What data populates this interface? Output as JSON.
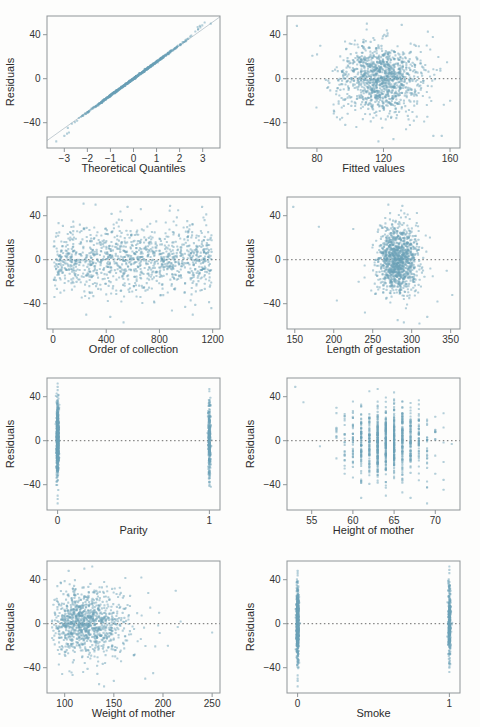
{
  "figure": {
    "shared_ylabel": "Residuals"
  },
  "colors": {
    "point": "#6ba1b7",
    "point_opacity": 0.5,
    "panel_border": "#8f9598",
    "tick_text": "#333333",
    "label_text": "#2b2b2b",
    "zero_line": "#5a5a5a",
    "ref_line": "#c3cdd3",
    "background": "#fdfdfc"
  },
  "chart_data": [
    {
      "id": "qq-plot",
      "type": "scatter",
      "xlabel": "Theoretical Quantiles",
      "ylabel": "Residuals",
      "xlim": [
        -3.75,
        3.75
      ],
      "ylim": [
        -63,
        57
      ],
      "xticks": [
        -3,
        -2,
        -1,
        0,
        1,
        2,
        3
      ],
      "yticks": [
        40,
        0,
        -40
      ],
      "zero_line": false,
      "ref_line": {
        "slope": 15.0,
        "intercept": 0
      },
      "gen": {
        "kind": "qq",
        "n": 650,
        "seed": 11,
        "slope": 15.3,
        "noise": 0.4,
        "tail_dev": {
          "hi_start": 2.35,
          "hi_slope": 5,
          "lo_start": -2.55,
          "lo_slope": 2.5
        }
      },
      "extra_points": [
        [
          -3.35,
          -57
        ],
        [
          -3.0,
          -52
        ],
        [
          -2.88,
          -50
        ],
        [
          -2.8,
          -49
        ],
        [
          2.78,
          47
        ],
        [
          2.88,
          48
        ],
        [
          2.98,
          48.5
        ],
        [
          3.35,
          50
        ]
      ]
    },
    {
      "id": "fitted-values",
      "type": "scatter",
      "xlabel": "Fitted values",
      "ylabel": "Residuals",
      "xlim": [
        62,
        166
      ],
      "ylim": [
        -63,
        57
      ],
      "xticks": [
        80,
        120,
        160
      ],
      "yticks": [
        40,
        0,
        -40
      ],
      "zero_line": true,
      "gen": {
        "kind": "cloud",
        "n": 1150,
        "seed": 22,
        "x": {
          "dist": "normal",
          "mean": 119,
          "sd": 12.5,
          "clip": [
            67,
            159
          ]
        },
        "y": {
          "dist": "normal",
          "mean": 0,
          "sd": 15.5,
          "clip": [
            -50,
            47
          ]
        }
      },
      "extra_points": [
        [
          68,
          48
        ],
        [
          82,
          30
        ],
        [
          92,
          -35
        ],
        [
          97,
          -42
        ],
        [
          117,
          -57
        ],
        [
          126,
          -55
        ],
        [
          150,
          -52
        ],
        [
          155,
          -52
        ],
        [
          160,
          -20
        ],
        [
          152,
          8
        ],
        [
          148,
          2
        ],
        [
          144,
          -2
        ],
        [
          110,
          50
        ],
        [
          131,
          49
        ],
        [
          122,
          44
        ]
      ]
    },
    {
      "id": "order-of-collection",
      "type": "scatter",
      "xlabel": "Order of collection",
      "ylabel": "Residuals",
      "xlim": [
        -45,
        1255
      ],
      "ylim": [
        -63,
        57
      ],
      "xticks": [
        0,
        400,
        800,
        1200
      ],
      "yticks": [
        40,
        0,
        -40
      ],
      "zero_line": true,
      "gen": {
        "kind": "cloud",
        "n": 1150,
        "seed": 33,
        "x": {
          "dist": "uniform",
          "min": 4,
          "max": 1192,
          "clip": [
            4,
            1192
          ]
        },
        "y": {
          "dist": "normal",
          "mean": 0,
          "sd": 15,
          "clip": [
            -48,
            46
          ]
        }
      },
      "extra_points": [
        [
          320,
          50
        ],
        [
          560,
          48
        ],
        [
          660,
          46
        ],
        [
          250,
          -50
        ],
        [
          530,
          -57
        ],
        [
          1050,
          -50
        ],
        [
          1120,
          48
        ],
        [
          230,
          51
        ],
        [
          880,
          49
        ],
        [
          430,
          -52
        ]
      ]
    },
    {
      "id": "length-of-gestation",
      "type": "scatter",
      "xlabel": "Length of gestation",
      "ylabel": "Residuals",
      "xlim": [
        140,
        362
      ],
      "ylim": [
        -63,
        57
      ],
      "xticks": [
        150,
        200,
        250,
        300,
        350
      ],
      "yticks": [
        40,
        0,
        -40
      ],
      "zero_line": true,
      "gen": {
        "kind": "cloud",
        "n": 1100,
        "seed": 44,
        "x": {
          "dist": "normal",
          "mean": 281,
          "sd": 13,
          "clip": [
            222,
            338
          ]
        },
        "y": {
          "dist": "normal",
          "mean": 0,
          "sd": 15.5,
          "clip": [
            -50,
            47
          ]
        }
      },
      "extra_points": [
        [
          148,
          48
        ],
        [
          181,
          30
        ],
        [
          204,
          -37
        ],
        [
          225,
          28
        ],
        [
          232,
          -20
        ],
        [
          240,
          -48
        ],
        [
          352,
          -32
        ],
        [
          345,
          -10
        ],
        [
          333,
          -38
        ],
        [
          320,
          -52
        ],
        [
          310,
          -58
        ],
        [
          327,
          -15
        ],
        [
          318,
          22
        ],
        [
          290,
          -57
        ],
        [
          282,
          -55
        ],
        [
          270,
          50
        ],
        [
          288,
          49
        ]
      ]
    },
    {
      "id": "parity",
      "type": "scatter",
      "xlabel": "Parity",
      "ylabel": "Residuals",
      "xlim": [
        -0.07,
        1.07
      ],
      "ylim": [
        -63,
        57
      ],
      "xticks": [
        0,
        1
      ],
      "yticks": [
        40,
        0,
        -40
      ],
      "zero_line": true,
      "gen": {
        "kind": "cloud",
        "n": 950,
        "seed": 55,
        "x": {
          "dist": "binary",
          "values": [
            0,
            1
          ],
          "p0": 0.67,
          "jitter": 0.004,
          "clip": [
            -0.05,
            1.05
          ]
        },
        "y": {
          "dist": "normal",
          "mean": 0,
          "sd": 16,
          "clip": [
            -45,
            43
          ]
        }
      },
      "extra_points": [
        [
          0,
          52
        ],
        [
          0,
          49
        ],
        [
          0,
          46
        ],
        [
          0,
          -50
        ],
        [
          0,
          -53
        ],
        [
          0,
          -57
        ],
        [
          1,
          47
        ],
        [
          1,
          45
        ],
        [
          1,
          -38
        ],
        [
          1,
          -41
        ]
      ]
    },
    {
      "id": "height-of-mother",
      "type": "scatter",
      "xlabel": "Height of mother",
      "ylabel": "Residuals",
      "xlim": [
        52,
        73
      ],
      "ylim": [
        -63,
        57
      ],
      "xticks": [
        55,
        60,
        65,
        70
      ],
      "yticks": [
        40,
        0,
        -40
      ],
      "zero_line": true,
      "gen": {
        "kind": "cloud",
        "n": 950,
        "seed": 66,
        "x": {
          "dist": "integer-normal",
          "mean": 64.2,
          "sd": 2.4,
          "clip": [
            58,
            71
          ]
        },
        "y": {
          "dist": "normal",
          "mean": 0,
          "sd": 15,
          "clip": [
            -45,
            43
          ]
        }
      },
      "extra_points": [
        [
          53,
          49
        ],
        [
          54,
          35
        ],
        [
          56,
          -5
        ],
        [
          58,
          30
        ],
        [
          58,
          10
        ],
        [
          69,
          -57
        ],
        [
          72,
          -3
        ],
        [
          71,
          25
        ],
        [
          71,
          12
        ],
        [
          70,
          -30
        ],
        [
          61,
          -52
        ],
        [
          64,
          -50
        ],
        [
          63,
          47
        ],
        [
          66,
          -47
        ],
        [
          67,
          -52
        ],
        [
          65,
          44
        ],
        [
          62,
          45
        ]
      ]
    },
    {
      "id": "weight-of-mother",
      "type": "scatter",
      "xlabel": "Weight of mother",
      "ylabel": "Residuals",
      "xlim": [
        82,
        258
      ],
      "ylim": [
        -63,
        57
      ],
      "xticks": [
        100,
        150,
        200,
        250
      ],
      "yticks": [
        40,
        0,
        -40
      ],
      "zero_line": true,
      "gen": {
        "kind": "cloud",
        "n": 1000,
        "seed": 77,
        "x": {
          "dist": "lognormal",
          "mu": 4.8,
          "sigma": 0.16,
          "clip": [
            87,
            200
          ]
        },
        "y": {
          "dist": "normal",
          "mean": 0,
          "sd": 15.5,
          "clip": [
            -48,
            46
          ]
        }
      },
      "extra_points": [
        [
          250,
          -8
        ],
        [
          218,
          2
        ],
        [
          213,
          30
        ],
        [
          215,
          -3
        ],
        [
          205,
          -20
        ],
        [
          196,
          10
        ],
        [
          190,
          -45
        ],
        [
          185,
          28
        ],
        [
          182,
          -50
        ],
        [
          178,
          42
        ],
        [
          140,
          -57
        ],
        [
          128,
          52
        ],
        [
          120,
          50
        ],
        [
          104,
          48
        ],
        [
          135,
          -55
        ],
        [
          150,
          -52
        ]
      ]
    },
    {
      "id": "smoke",
      "type": "scatter",
      "xlabel": "Smoke",
      "ylabel": "Residuals",
      "xlim": [
        -0.07,
        1.07
      ],
      "ylim": [
        -63,
        57
      ],
      "xticks": [
        0,
        1
      ],
      "yticks": [
        40,
        0,
        -40
      ],
      "zero_line": true,
      "gen": {
        "kind": "cloud",
        "n": 1000,
        "seed": 88,
        "x": {
          "dist": "binary",
          "values": [
            0,
            1
          ],
          "p0": 0.65,
          "jitter": 0.004,
          "clip": [
            -0.05,
            1.05
          ]
        },
        "y": {
          "dist": "normal",
          "mean": 0,
          "sd": 16,
          "clip": [
            -44,
            42
          ]
        }
      },
      "extra_points": [
        [
          0,
          48
        ],
        [
          0,
          46
        ],
        [
          0,
          44
        ],
        [
          0,
          -47
        ],
        [
          0,
          -50
        ],
        [
          0,
          -52
        ],
        [
          0,
          -57
        ],
        [
          1,
          52
        ],
        [
          1,
          49
        ],
        [
          1,
          46
        ],
        [
          1,
          -40
        ],
        [
          1,
          -44
        ]
      ]
    }
  ]
}
